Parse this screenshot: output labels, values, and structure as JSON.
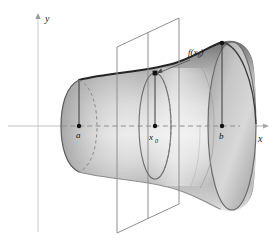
{
  "figure": {
    "background_color": "#ffffff",
    "width": 274,
    "height": 246
  },
  "axes": {
    "x_axis": {
      "label": "x",
      "color": "#b3b3b3",
      "y_pixel": 126,
      "x_start": 8,
      "x_end": 266,
      "arrow": true
    },
    "y_axis": {
      "label": "y",
      "color": "#cfcfcf",
      "x_pixel": 38,
      "y_start": 14,
      "y_end": 232,
      "arrow": true
    }
  },
  "labels": {
    "a": "a",
    "x0_base": "x",
    "x0_sub": "0",
    "b": "b",
    "f_prefix": "f(x",
    "f_sub": "0",
    "f_suffix": ")",
    "f_full": "f(x0)",
    "x_axis": "x",
    "y_axis": "y"
  },
  "marked_points": [
    {
      "name": "a",
      "label": "a",
      "x": 79,
      "y": 126,
      "radius_top_y": 80
    },
    {
      "name": "x0",
      "label": "x0",
      "x": 155,
      "y": 126,
      "radius_top_y": 73
    },
    {
      "name": "b",
      "label": "b",
      "x": 222,
      "y": 126,
      "radius_top_y": 60
    }
  ],
  "cutting_plane": {
    "description": "vertical plane perpendicular to the x-axis at x0",
    "stroke": "#8f8f8f",
    "corners": [
      {
        "x": 117,
        "y": 47
      },
      {
        "x": 179,
        "y": 18
      },
      {
        "x": 179,
        "y": 204
      },
      {
        "x": 117,
        "y": 233
      }
    ]
  },
  "cross_section": {
    "description": "circular cross-section at x0 shown as an ellipse",
    "center_x": 155,
    "center_y": 126,
    "rx": 16,
    "ry": 53,
    "stroke": "#6e6e6e"
  },
  "solid": {
    "description": "solid of revolution, trumpet-shaped, generated by rotating y=f(x) about the x-axis on [a,b]",
    "fill_light": "#f2f2f2",
    "fill_mid": "#bdbdbd",
    "fill_dark": "#6a6a6a",
    "outline": "#2a2a2a",
    "left_cap_dashed": true,
    "right_opening_ellipse": true
  },
  "colors": {
    "background": "#ffffff",
    "axis_gray": "#c4c4c4",
    "plane_gray": "#8f8f8f",
    "outline_dark": "#222222",
    "dash_gray": "#8a8a8a",
    "text": "#111111"
  }
}
